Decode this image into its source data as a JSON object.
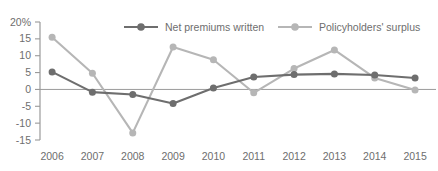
{
  "chart_data": {
    "type": "line",
    "title": "",
    "xlabel": "",
    "ylabel": "",
    "categories": [
      "2006",
      "2007",
      "2008",
      "2009",
      "2010",
      "2011",
      "2012",
      "2013",
      "2014",
      "2015"
    ],
    "ylim": [
      -15,
      20
    ],
    "yticks": [
      20,
      15,
      10,
      5,
      0,
      -5,
      -10,
      -15
    ],
    "ytick_labels": [
      "20%",
      "15",
      "10",
      "5",
      "0",
      "-5",
      "-10",
      "-15"
    ],
    "grid": false,
    "zero_line": true,
    "legend_position": "top-center",
    "series": [
      {
        "name": "Net premiums written",
        "color": "#6e6e6e",
        "values": [
          5.2,
          -0.8,
          -1.5,
          -4.2,
          0.4,
          3.7,
          4.4,
          4.6,
          4.3,
          3.4
        ]
      },
      {
        "name": "Policyholders' surplus",
        "color": "#b6b6b6",
        "values": [
          15.5,
          4.8,
          -12.9,
          12.6,
          8.8,
          -1.0,
          6.2,
          11.7,
          3.4,
          -0.2
        ]
      }
    ]
  },
  "axis": {
    "y_top_label": "20%",
    "first_year": "2006",
    "last_year": "2015"
  }
}
